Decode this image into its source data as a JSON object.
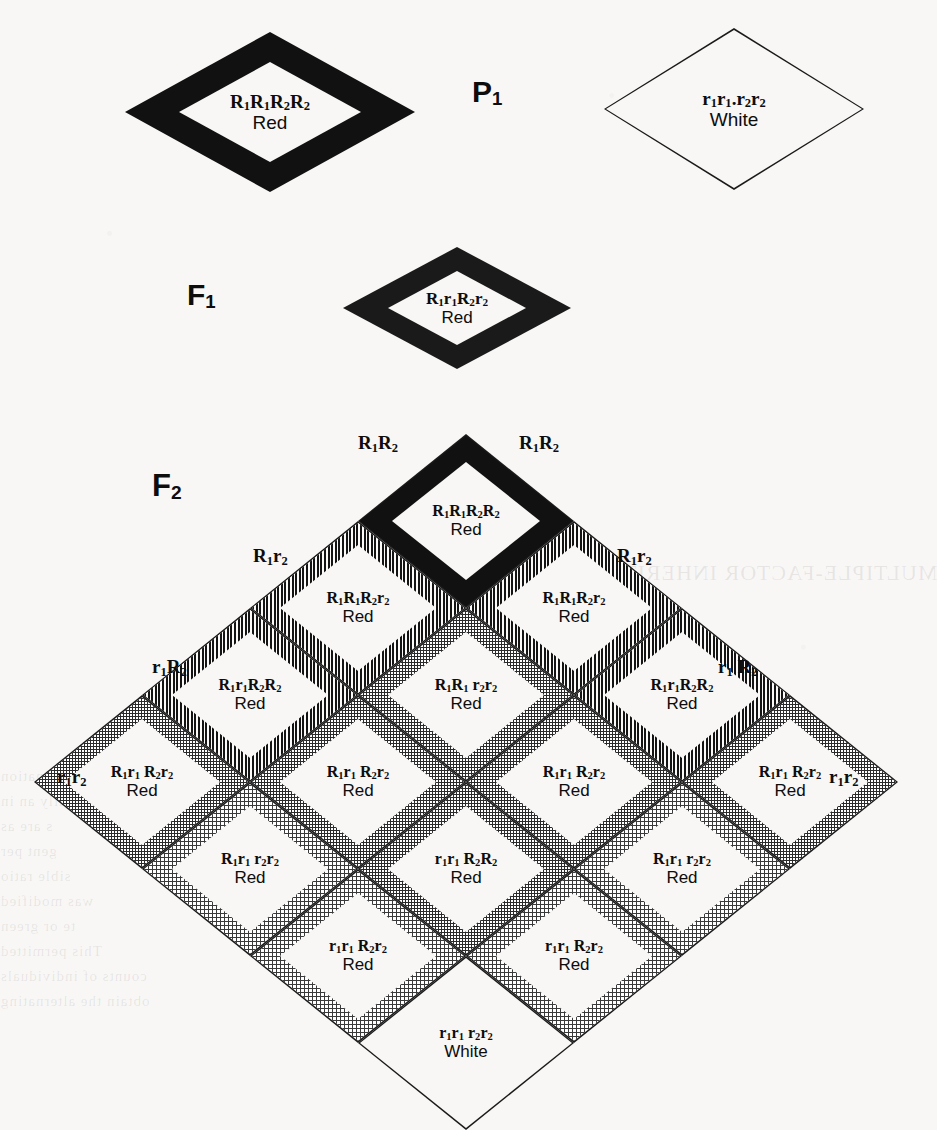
{
  "figure": {
    "type": "genetics-punnett-square",
    "background_color": "#f8f7f5",
    "ink_color": "#0d0d0d"
  },
  "generations": {
    "p1": {
      "stage_label": "P",
      "stage_sub": "1",
      "parents": [
        {
          "genotype_html": "R<sub>1</sub>R<sub>1</sub>R<sub>2</sub>R<sub>2</sub>",
          "genotype_text": "R1R1R2R2",
          "phenotype": "Red",
          "fill": "black"
        },
        {
          "genotype_html": "r<sub>1</sub>r<sub>1</sub>.r<sub>2</sub>r<sub>2</sub>",
          "genotype_text": "r1r1.r2r2",
          "phenotype": "White",
          "fill": "white"
        }
      ]
    },
    "f1": {
      "stage_label": "F",
      "stage_sub": "1",
      "offspring": [
        {
          "genotype_html": "R<sub>1</sub>r<sub>1</sub>R<sub>2</sub>r<sub>2</sub>",
          "genotype_text": "R1r1R2r2",
          "phenotype": "Red",
          "fill": "dot-med"
        }
      ]
    },
    "f2": {
      "stage_label": "F",
      "stage_sub": "2"
    }
  },
  "gametes": {
    "top_left": {
      "html": "R<sub>1</sub>R<sub>2</sub>",
      "text": "R1R2"
    },
    "top_right": {
      "html": "R<sub>1</sub>R<sub>2</sub>",
      "text": "R1R2"
    },
    "upper_left": {
      "html": "R<sub>1</sub>r<sub>2</sub>",
      "text": "R1r2"
    },
    "upper_right": {
      "html": "R<sub>1</sub>r<sub>2</sub>",
      "text": "R1r2"
    },
    "mid_left": {
      "html": "r<sub>1</sub>R<sub>2</sub>",
      "text": "r1R2"
    },
    "mid_right": {
      "html": "r<sub>1</sub> R<sub>2</sub>",
      "text": "r1R2"
    },
    "lower_left": {
      "html": "r<sub>1</sub>r<sub>2</sub>",
      "text": "r1r2"
    },
    "lower_right": {
      "html": "r<sub>1</sub>r<sub>2</sub>",
      "text": "r1r2"
    }
  },
  "chart_data": {
    "type": "table",
    "gamete_axis_labels": [
      "R1R2",
      "R1r2",
      "r1R2",
      "r1r2"
    ],
    "phenotype_ratio": "15 Red : 1 White",
    "rows": [
      {
        "row_index": 1,
        "cells": [
          {
            "col": 1,
            "genotype_html": "R<sub>1</sub>R<sub>1</sub>R<sub>2</sub>R<sub>2</sub>",
            "genotype_text": "R1R1R2R2",
            "phenotype": "Red",
            "fill": "black",
            "dose": 4
          }
        ]
      },
      {
        "row_index": 2,
        "cells": [
          {
            "col": 1,
            "genotype_html": "R<sub>1</sub>R<sub>1</sub>R<sub>2</sub>r<sub>2</sub>",
            "genotype_text": "R1R1R2r2",
            "phenotype": "Red",
            "fill": "stripe",
            "dose": 3
          },
          {
            "col": 2,
            "genotype_html": "R<sub>1</sub>R<sub>1</sub>R<sub>2</sub>r<sub>2</sub>",
            "genotype_text": "R1R1R2r2",
            "phenotype": "Red",
            "fill": "stripe",
            "dose": 3
          }
        ]
      },
      {
        "row_index": 3,
        "cells": [
          {
            "col": 1,
            "genotype_html": "R<sub>1</sub>r<sub>1</sub>R<sub>2</sub>R<sub>2</sub>",
            "genotype_text": "R1r1R2R2",
            "phenotype": "Red",
            "fill": "stripe",
            "dose": 3
          },
          {
            "col": 2,
            "genotype_html": "R<sub>1</sub>R<sub>1</sub> r<sub>2</sub>r<sub>2</sub>",
            "genotype_text": "R1R1r2r2",
            "phenotype": "Red",
            "fill": "dot-med",
            "dose": 2
          },
          {
            "col": 3,
            "genotype_html": "R<sub>1</sub>r<sub>1</sub>R<sub>2</sub>R<sub>2</sub>",
            "genotype_text": "R1r1R2R2",
            "phenotype": "Red",
            "fill": "stripe",
            "dose": 3
          }
        ]
      },
      {
        "row_index": 4,
        "cells": [
          {
            "col": 1,
            "genotype_html": "R<sub>1</sub>r<sub>1</sub> R<sub>2</sub>r<sub>2</sub>",
            "genotype_text": "R1r1R2r2",
            "phenotype": "Red",
            "fill": "dot-med",
            "dose": 2
          },
          {
            "col": 2,
            "genotype_html": "R<sub>1</sub>r<sub>1</sub> R<sub>2</sub>r<sub>2</sub>",
            "genotype_text": "R1r1R2r2",
            "phenotype": "Red",
            "fill": "dot-med",
            "dose": 2
          },
          {
            "col": 3,
            "genotype_html": "R<sub>1</sub>r<sub>1</sub> R<sub>2</sub>r<sub>2</sub>",
            "genotype_text": "R1r1R2r2",
            "phenotype": "Red",
            "fill": "dot-med",
            "dose": 2
          },
          {
            "col": 4,
            "genotype_html": "R<sub>1</sub>r<sub>1</sub> R<sub>2</sub>r<sub>2</sub>",
            "genotype_text": "R1r1R2r2",
            "phenotype": "Red",
            "fill": "dot-med",
            "dose": 2
          }
        ]
      },
      {
        "row_index": 5,
        "cells": [
          {
            "col": 1,
            "genotype_html": "R<sub>1</sub>r<sub>1</sub> r<sub>2</sub>r<sub>2</sub>",
            "genotype_text": "R1r1r2r2",
            "phenotype": "Red",
            "fill": "dot-light",
            "dose": 1
          },
          {
            "col": 2,
            "genotype_html": "r<sub>1</sub>r<sub>1</sub> R<sub>2</sub>R<sub>2</sub>",
            "genotype_text": "r1r1R2R2",
            "phenotype": "Red",
            "fill": "dot-med",
            "dose": 2
          },
          {
            "col": 3,
            "genotype_html": "R<sub>1</sub>r<sub>1</sub> r<sub>2</sub>r<sub>2</sub>",
            "genotype_text": "R1r1r2r2",
            "phenotype": "Red",
            "fill": "dot-light",
            "dose": 1
          }
        ]
      },
      {
        "row_index": 6,
        "cells": [
          {
            "col": 1,
            "genotype_html": "r<sub>1</sub>r<sub>1</sub> R<sub>2</sub>r<sub>2</sub>",
            "genotype_text": "r1r1R2r2",
            "phenotype": "Red",
            "fill": "dot-light",
            "dose": 1
          },
          {
            "col": 2,
            "genotype_html": "r<sub>1</sub>r<sub>1</sub> R<sub>2</sub>r<sub>2</sub>",
            "genotype_text": "r1r1R2r2",
            "phenotype": "Red",
            "fill": "dot-light",
            "dose": 1
          }
        ]
      },
      {
        "row_index": 7,
        "cells": [
          {
            "col": 1,
            "genotype_html": "r<sub>1</sub>r<sub>1</sub> r<sub>2</sub>r<sub>2</sub>",
            "genotype_text": "r1r1r2r2",
            "phenotype": "White",
            "fill": "white",
            "dose": 0
          }
        ]
      }
    ]
  },
  "ghost_marginalia": [
    {
      "text": "MULTIPLE-FACTOR INHERITANCE",
      "x": 560,
      "y": 560,
      "size": 22
    },
    {
      "text": "mination",
      "x": 0,
      "y": 768,
      "size": 15
    },
    {
      "text": "ally an in",
      "x": 0,
      "y": 793,
      "size": 15
    },
    {
      "text": "s are as",
      "x": 0,
      "y": 818,
      "size": 15
    },
    {
      "text": "gent per",
      "x": 0,
      "y": 843,
      "size": 15
    },
    {
      "text": "sible ratio",
      "x": 0,
      "y": 868,
      "size": 15
    },
    {
      "text": "was modified",
      "x": 0,
      "y": 893,
      "size": 15
    },
    {
      "text": "te or green",
      "x": 0,
      "y": 918,
      "size": 15
    },
    {
      "text": "This permitted",
      "x": 0,
      "y": 943,
      "size": 15
    },
    {
      "text": "counts of individuals",
      "x": 0,
      "y": 968,
      "size": 15
    },
    {
      "text": "obtain the alternating",
      "x": 0,
      "y": 993,
      "size": 15
    },
    {
      "text": "they were",
      "x": 340,
      "y": 768,
      "size": 15
    },
    {
      "text": "in heavy",
      "x": 430,
      "y": 793,
      "size": 15
    },
    {
      "text": "yielding",
      "x": 470,
      "y": 818,
      "size": 15
    },
    {
      "text": "are hard to",
      "x": 470,
      "y": 843,
      "size": 15
    },
    {
      "text": "varying ratio",
      "x": 430,
      "y": 868,
      "size": 15
    },
    {
      "text": "of green, instead of",
      "x": 380,
      "y": 893,
      "size": 15
    },
    {
      "text": "offspring of hybrids. The",
      "x": 330,
      "y": 918,
      "size": 15
    },
    {
      "text": "in color in tobacco",
      "x": 330,
      "y": 943,
      "size": 15
    },
    {
      "text": "Negroes and white women",
      "x": 330,
      "y": 968,
      "size": 15
    },
    {
      "text": "on. All this seems to",
      "x": 330,
      "y": 993,
      "size": 15
    }
  ]
}
